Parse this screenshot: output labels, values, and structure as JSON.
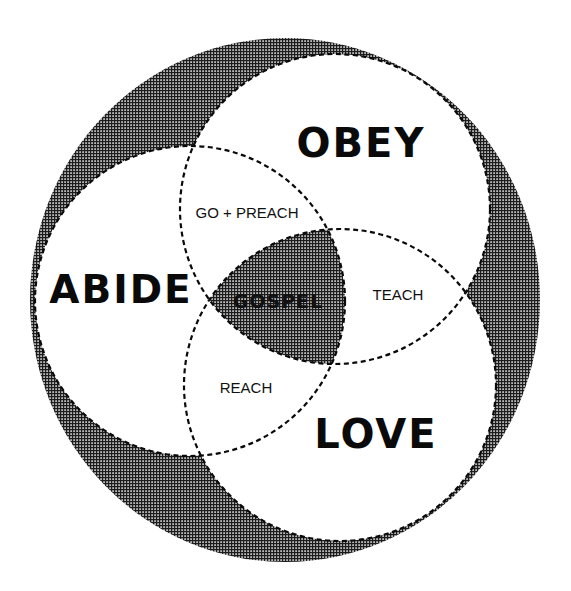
{
  "diagram": {
    "type": "venn",
    "colors": {
      "background": "#ffffff",
      "shade_dark": "#1a1a1a",
      "shade_light": "#b5b5b5",
      "ink": "#0a0a0a"
    },
    "circles": [
      {
        "id": "abide",
        "label": "ABIDE"
      },
      {
        "id": "obey",
        "label": "OBEY"
      },
      {
        "id": "love",
        "label": "LOVE"
      }
    ],
    "intersections": {
      "abide_obey": "GO + PREACH",
      "obey_love": "TEACH",
      "abide_love": "REACH",
      "center": "GOSPEL"
    }
  }
}
